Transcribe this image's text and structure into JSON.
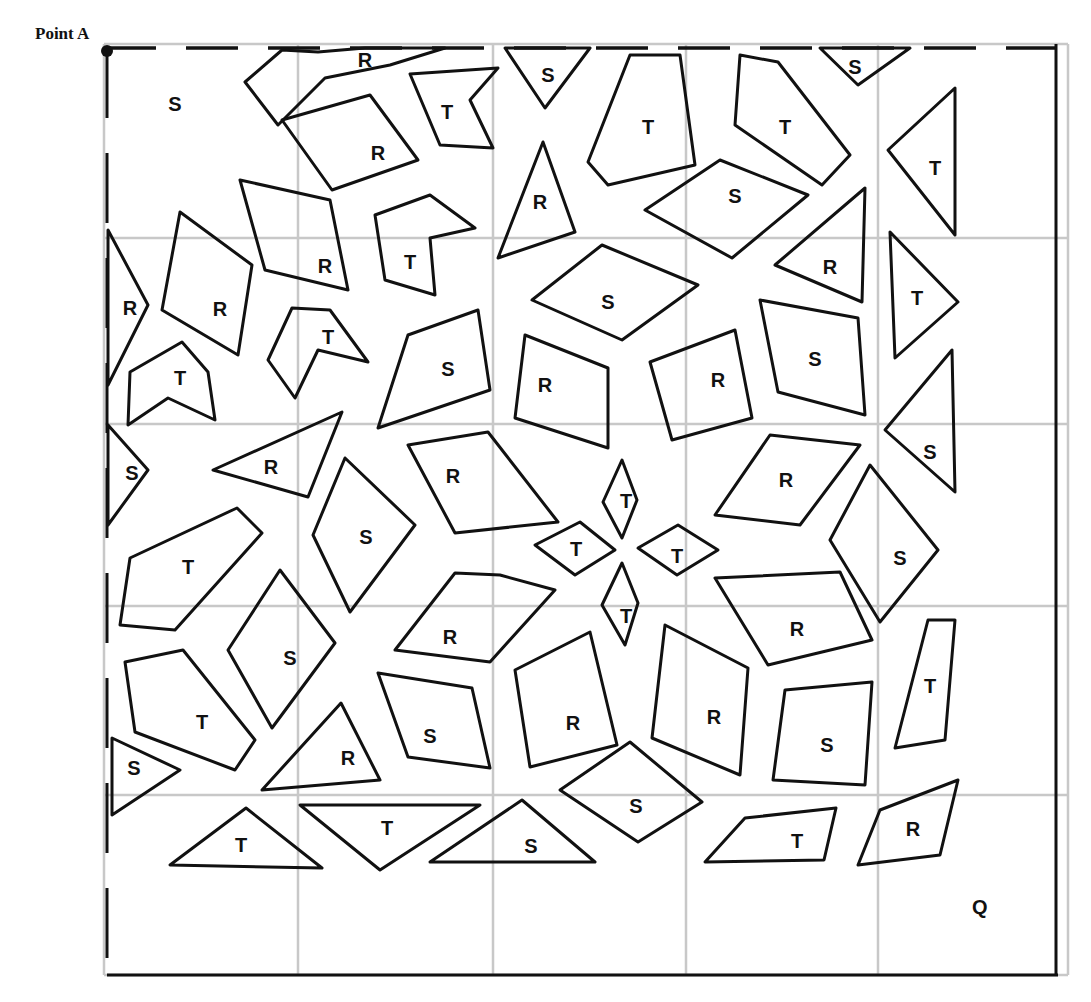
{
  "labels": {
    "point_a": "Point A",
    "q": "Q"
  },
  "grid": {
    "x": [
      104,
      298,
      493,
      686,
      878,
      1068
    ],
    "y": [
      44,
      238,
      424,
      606,
      795,
      975
    ]
  },
  "colors": {
    "stroke": "#111111",
    "grid": "#c8c8c8",
    "background": "#ffffff"
  },
  "shapes": [
    {
      "label": "S",
      "tx": 175,
      "ty": 104,
      "points": ""
    },
    {
      "label": "R",
      "tx": 365,
      "ty": 60,
      "points": "245,82 282,50 318,52 365,48 445,48 390,65 325,78 278,125"
    },
    {
      "label": "T",
      "tx": 447,
      "ty": 112,
      "points": "410,74 498,68 470,100 493,148 440,145"
    },
    {
      "label": "S",
      "tx": 548,
      "ty": 75,
      "points": "505,48 545,108 590,48"
    },
    {
      "label": "T",
      "tx": 648,
      "ty": 127,
      "points": "630,55 680,55 695,165 608,185 588,162"
    },
    {
      "label": "T",
      "tx": 785,
      "ty": 127,
      "points": "740,55 778,62 850,155 822,185 735,125"
    },
    {
      "label": "S",
      "tx": 855,
      "ty": 67,
      "points": "820,48 858,85 910,48"
    },
    {
      "label": "R",
      "tx": 378,
      "ty": 153,
      "points": "282,120 370,95 418,160 332,190"
    },
    {
      "label": "T",
      "tx": 935,
      "ty": 168,
      "points": "888,150 955,88 955,235"
    },
    {
      "label": "R",
      "tx": 540,
      "ty": 202,
      "points": "543,142 575,232 498,258"
    },
    {
      "label": "S",
      "tx": 735,
      "ty": 196,
      "points": "645,210 720,160 808,195 732,258"
    },
    {
      "label": "R",
      "tx": 325,
      "ty": 266,
      "points": "240,180 330,200 348,290 265,270"
    },
    {
      "label": "T",
      "tx": 410,
      "ty": 262,
      "points": "375,215 430,195 475,228 430,238 435,295 385,280"
    },
    {
      "label": "R",
      "tx": 220,
      "ty": 309,
      "points": "180,212 252,265 238,355 162,310"
    },
    {
      "label": "R",
      "tx": 130,
      "ty": 308,
      "points": "108,230 148,305 108,385"
    },
    {
      "label": "R",
      "tx": 830,
      "ty": 267,
      "points": "775,265 865,188 862,302"
    },
    {
      "label": "T",
      "tx": 917,
      "ty": 298,
      "points": "890,232 958,302 895,358"
    },
    {
      "label": "S",
      "tx": 608,
      "ty": 302,
      "points": "532,300 602,245 698,285 622,340"
    },
    {
      "label": "T",
      "tx": 328,
      "ty": 337,
      "points": "292,308 330,310 368,362 318,350 295,398 268,360"
    },
    {
      "label": "S",
      "tx": 448,
      "ty": 369,
      "points": "408,335 478,310 490,390 378,428"
    },
    {
      "label": "R",
      "tx": 545,
      "ty": 385,
      "points": "525,335 608,368 608,448 515,418"
    },
    {
      "label": "R",
      "tx": 718,
      "ty": 380,
      "points": "650,362 735,330 752,418 672,440"
    },
    {
      "label": "S",
      "tx": 815,
      "ty": 359,
      "points": "760,300 858,318 865,415 778,392"
    },
    {
      "label": "T",
      "tx": 180,
      "ty": 378,
      "points": "130,372 182,342 208,372 215,420 168,398 128,425"
    },
    {
      "label": "S",
      "tx": 930,
      "ty": 452,
      "points": "885,430 952,350 955,492"
    },
    {
      "label": "S",
      "tx": 132,
      "ty": 473,
      "points": "108,425 148,470 108,525"
    },
    {
      "label": "R",
      "tx": 271,
      "ty": 467,
      "points": "213,470 342,412 308,497"
    },
    {
      "label": "R",
      "tx": 453,
      "ty": 476,
      "points": "408,445 488,432 558,522 455,533"
    },
    {
      "label": "S",
      "tx": 366,
      "ty": 537,
      "points": "345,458 415,525 350,612 313,535"
    },
    {
      "label": "R",
      "tx": 786,
      "ty": 480,
      "points": "770,435 860,445 800,525 715,515"
    },
    {
      "label": "T",
      "tx": 626,
      "ty": 501,
      "points": "622,460 637,500 622,538 603,502"
    },
    {
      "label": "T",
      "tx": 576,
      "ty": 549,
      "points": "535,545 580,522 615,550 575,575"
    },
    {
      "label": "T",
      "tx": 677,
      "ty": 556,
      "points": "638,548 678,525 718,550 677,575"
    },
    {
      "label": "T",
      "tx": 188,
      "ty": 567,
      "points": "130,558 237,508 262,533 175,630 120,625"
    },
    {
      "label": "S",
      "tx": 900,
      "ty": 558,
      "points": "870,465 938,550 880,622 830,540"
    },
    {
      "label": "T",
      "tx": 626,
      "ty": 616,
      "points": "622,563 638,603 625,645 602,605"
    },
    {
      "label": "R",
      "tx": 450,
      "ty": 637,
      "points": "455,573 500,575 555,590 490,662 395,650"
    },
    {
      "label": "R",
      "tx": 797,
      "ty": 629,
      "points": "715,578 840,572 872,640 768,665"
    },
    {
      "label": "S",
      "tx": 290,
      "ty": 658,
      "points": "280,570 335,643 272,728 228,650"
    },
    {
      "label": "T",
      "tx": 202,
      "ty": 722,
      "points": "125,662 183,650 255,740 235,770 135,732"
    },
    {
      "label": "S",
      "tx": 430,
      "ty": 736,
      "points": "378,673 472,688 490,768 408,757"
    },
    {
      "label": "R",
      "tx": 573,
      "ty": 723,
      "points": "515,670 590,632 617,745 530,767"
    },
    {
      "label": "R",
      "tx": 714,
      "ty": 717,
      "points": "665,625 748,668 740,775 652,738"
    },
    {
      "label": "T",
      "tx": 930,
      "ty": 686,
      "points": "928,620 955,620 945,740 895,748"
    },
    {
      "label": "S",
      "tx": 827,
      "ty": 745,
      "points": "785,690 872,682 865,785 773,780"
    },
    {
      "label": "R",
      "tx": 348,
      "ty": 758,
      "points": "341,703 380,780 262,790"
    },
    {
      "label": "S",
      "tx": 134,
      "ty": 768,
      "points": "112,738 180,770 112,815"
    },
    {
      "label": "S",
      "tx": 636,
      "ty": 806,
      "points": "560,790 630,742 702,802 638,842"
    },
    {
      "label": "T",
      "tx": 241,
      "ty": 845,
      "points": "170,865 246,808 322,868"
    },
    {
      "label": "T",
      "tx": 387,
      "ty": 828,
      "points": "300,805 480,805 380,870"
    },
    {
      "label": "S",
      "tx": 531,
      "ty": 846,
      "points": "430,862 522,800 595,862"
    },
    {
      "label": "T",
      "tx": 797,
      "ty": 841,
      "points": "705,862 745,818 836,808 824,860"
    },
    {
      "label": "R",
      "tx": 913,
      "ty": 829,
      "points": "880,810 958,780 940,855 858,865"
    }
  ]
}
